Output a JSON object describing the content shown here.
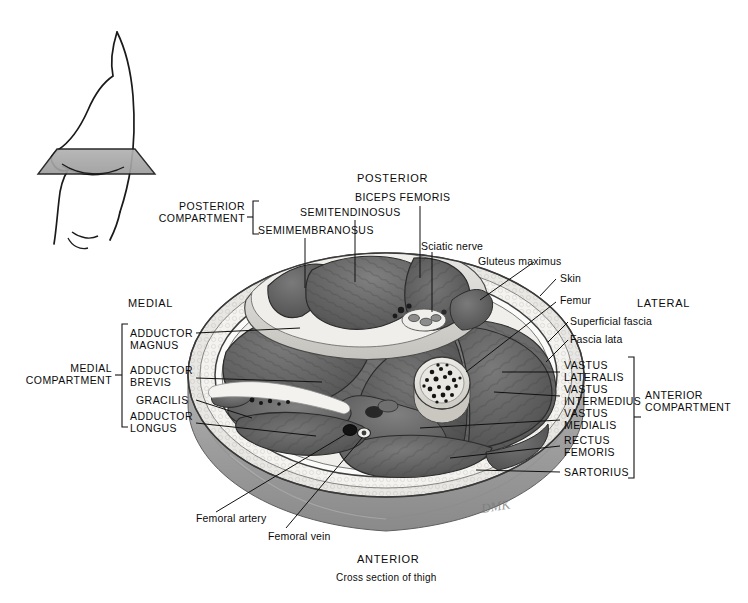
{
  "figure": {
    "title": "Cross section of thigh",
    "orientation": {
      "posterior": "POSTERIOR",
      "anterior": "ANTERIOR",
      "medial": "MEDIAL",
      "lateral": "LATERAL"
    },
    "signature": "DMK"
  },
  "compartments": {
    "posterior": {
      "line1": "POSTERIOR",
      "line2": "COMPARTMENT"
    },
    "medial": {
      "line1": "MEDIAL",
      "line2": "COMPARTMENT"
    },
    "anterior": {
      "line1": "ANTERIOR",
      "line2": "COMPARTMENT"
    }
  },
  "labels": {
    "posterior_group": [
      {
        "name": "semimembranosus",
        "text": "SEMIMEMBRANOSUS"
      },
      {
        "name": "semitendinosus",
        "text": "SEMITENDINOSUS"
      },
      {
        "name": "biceps-femoris",
        "text": "BICEPS FEMORIS"
      }
    ],
    "medial_group": [
      {
        "name": "adductor-magnus",
        "line1": "ADDUCTOR",
        "line2": "MAGNUS"
      },
      {
        "name": "adductor-brevis",
        "line1": "ADDUCTOR",
        "line2": "BREVIS"
      },
      {
        "name": "gracilis",
        "line1": "GRACILIS",
        "line2": ""
      },
      {
        "name": "adductor-longus",
        "line1": "ADDUCTOR",
        "line2": "LONGUS"
      }
    ],
    "anterior_group": [
      {
        "name": "vastus-lateralis",
        "line1": "VASTUS",
        "line2": "LATERALIS"
      },
      {
        "name": "vastus-intermedius",
        "line1": "VASTUS",
        "line2": "INTERMEDIUS"
      },
      {
        "name": "vastus-medialis",
        "line1": "VASTUS",
        "line2": "MEDIALIS"
      },
      {
        "name": "rectus-femoris",
        "line1": "RECTUS",
        "line2": "FEMORIS"
      },
      {
        "name": "sartorius",
        "line1": "SARTORIUS",
        "line2": ""
      }
    ],
    "structures": [
      {
        "name": "sciatic-nerve",
        "text": "Sciatic nerve"
      },
      {
        "name": "gluteus-maximus",
        "text": "Gluteus maximus"
      },
      {
        "name": "skin",
        "text": "Skin"
      },
      {
        "name": "femur",
        "text": "Femur"
      },
      {
        "name": "superficial-fascia",
        "text": "Superficial fascia"
      },
      {
        "name": "fascia-lata",
        "text": "Fascia lata"
      },
      {
        "name": "femoral-artery",
        "text": "Femoral artery"
      },
      {
        "name": "femoral-vein",
        "text": "Femoral vein"
      }
    ]
  },
  "colors": {
    "background": "#ffffff",
    "ink": "#111111",
    "muscle_dark": "#5d5d5d",
    "muscle_mid": "#6e6e6e",
    "fascia_white": "#efefef",
    "bone": "#e6e4df",
    "skin_wall": "#9a9a9a",
    "plane_gray": "#a9a9a9"
  }
}
